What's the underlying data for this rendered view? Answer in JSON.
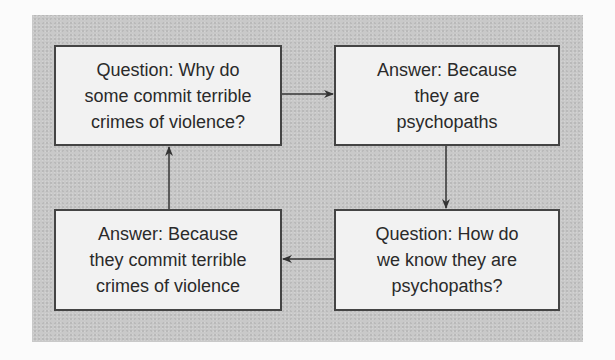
{
  "diagram": {
    "type": "circular-reasoning-cycle",
    "colors": {
      "panel_background": "#c9c9c9",
      "box_background": "#f2f2f2",
      "box_border": "#444444",
      "text": "#2a2a2a",
      "arrow": "#333333"
    },
    "nodes": [
      {
        "id": "q1",
        "position": "top-left",
        "text": "Question: Why do\nsome commit terrible\ncrimes of violence?"
      },
      {
        "id": "a1",
        "position": "top-right",
        "text": "Answer: Because\nthey are\npsychopaths"
      },
      {
        "id": "q2",
        "position": "bottom-right",
        "text": "Question: How do\nwe know they are\npsychopaths?"
      },
      {
        "id": "a2",
        "position": "bottom-left",
        "text": "Answer: Because\nthey commit terrible\ncrimes of violence"
      }
    ],
    "edges": [
      {
        "from": "q1",
        "to": "a1",
        "direction": "right"
      },
      {
        "from": "a1",
        "to": "q2",
        "direction": "down"
      },
      {
        "from": "q2",
        "to": "a2",
        "direction": "left"
      },
      {
        "from": "a2",
        "to": "q1",
        "direction": "up"
      }
    ]
  }
}
